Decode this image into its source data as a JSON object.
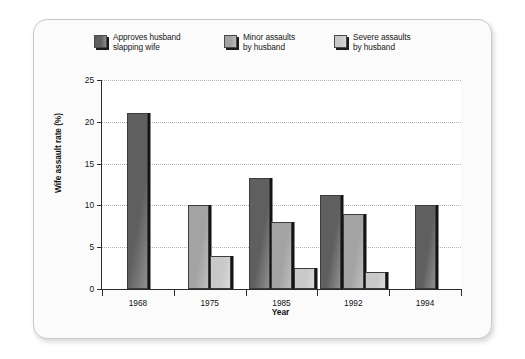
{
  "chart_data": {
    "type": "bar",
    "title": "",
    "xlabel": "Year",
    "ylabel": "Wife assault rate (%)",
    "categories": [
      "1968",
      "1975",
      "1985",
      "1992",
      "1994"
    ],
    "ylim": [
      0,
      25
    ],
    "yticks": [
      0,
      5,
      10,
      15,
      20,
      25
    ],
    "ytick_labels": [
      "0",
      "5",
      "10",
      "15",
      "20",
      "25"
    ],
    "grid": "horizontal-dotted",
    "legend_position": "top",
    "series": [
      {
        "name": "Approves husband slapping wife",
        "color": "#5f5f5f",
        "values": [
          21,
          null,
          13.3,
          11.2,
          10
        ]
      },
      {
        "name": "Minor assaults by husband",
        "color": "#a3a3a3",
        "values": [
          null,
          10,
          8,
          9,
          null
        ]
      },
      {
        "name": "Severe assaults by husband",
        "color": "#c9c9c9",
        "values": [
          null,
          4,
          2.5,
          2,
          null
        ]
      }
    ]
  },
  "legend": {
    "items": [
      {
        "label": "Approves husband\nslapping wife",
        "color": "#5f5f5f"
      },
      {
        "label": "Minor assaults\nby husband",
        "color": "#a3a3a3"
      },
      {
        "label": "Severe assaults\nby husband",
        "color": "#c9c9c9"
      }
    ]
  },
  "axes": {
    "y_title": "Wife assault rate (%)",
    "x_title": "Year"
  }
}
